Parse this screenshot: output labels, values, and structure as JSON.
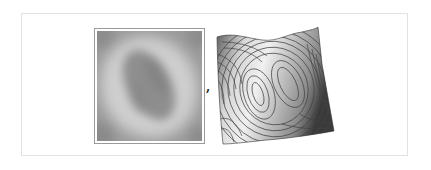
{
  "output_cell": {
    "separator": ",",
    "items": [
      {
        "kind": "density-plot",
        "description": "grayscale density plot of a 2D function",
        "colors": {
          "low": "#8a8a8a",
          "mid": "#b0b0b0",
          "high": "#d2d2d2"
        }
      },
      {
        "kind": "surface-plot",
        "description": "3D surface with contour lines",
        "colors": {
          "light": "#e6e6e6",
          "dark": "#3a3a3a",
          "contour": "#404040"
        }
      }
    ]
  }
}
